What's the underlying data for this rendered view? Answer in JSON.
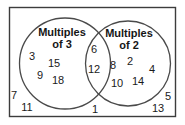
{
  "diagram": {
    "type": "venn-two-set",
    "universe_border_color": "#3c3c3c",
    "circle_stroke_color": "#4a4a4a",
    "background_color": "#ffffff",
    "text_color": "#1a1a1a",
    "sets": [
      {
        "id": "multiples-of-3",
        "title_line1": "Multiples",
        "title_line2": "of 3",
        "title_x": 62,
        "title_y1": 33,
        "title_y2": 45,
        "circle": {
          "cx": 65,
          "cy": 63.5,
          "r": 45.5
        }
      },
      {
        "id": "multiples-of-2",
        "title_line1": "Multiples",
        "title_line2": "of 2",
        "title_x": 129,
        "title_y1": 34,
        "title_y2": 46,
        "circle": {
          "cx": 128,
          "cy": 63.5,
          "r": 42.5
        }
      }
    ],
    "regions": {
      "left_only": {
        "label": "Multiples of 3 only",
        "items": [
          {
            "value": "3",
            "x": 32,
            "y": 57
          },
          {
            "value": "15",
            "x": 54,
            "y": 64
          },
          {
            "value": "9",
            "x": 40,
            "y": 76
          },
          {
            "value": "18",
            "x": 58,
            "y": 81
          }
        ]
      },
      "intersection": {
        "label": "Multiples of 3 and 2",
        "items": [
          {
            "value": "6",
            "x": 94,
            "y": 50
          },
          {
            "value": "12",
            "x": 94,
            "y": 70
          }
        ]
      },
      "right_only": {
        "label": "Multiples of 2 only",
        "items": [
          {
            "value": "8",
            "x": 113,
            "y": 66
          },
          {
            "value": "2",
            "x": 130,
            "y": 62
          },
          {
            "value": "4",
            "x": 152,
            "y": 70
          },
          {
            "value": "10",
            "x": 117,
            "y": 84
          },
          {
            "value": "14",
            "x": 138,
            "y": 82
          }
        ]
      },
      "outside": {
        "label": "Neither set",
        "items": [
          {
            "value": "7",
            "x": 14,
            "y": 96
          },
          {
            "value": "11",
            "x": 27,
            "y": 108
          },
          {
            "value": "1",
            "x": 95,
            "y": 110
          },
          {
            "value": "5",
            "x": 168,
            "y": 97
          },
          {
            "value": "13",
            "x": 158,
            "y": 109
          }
        ]
      }
    },
    "universe": {
      "x": 9.5,
      "y": 7.5,
      "width": 166,
      "height": 109
    }
  }
}
